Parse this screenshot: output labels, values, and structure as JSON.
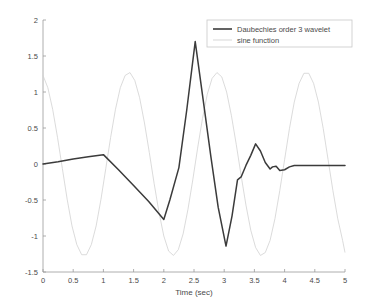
{
  "chart_data": {
    "type": "line",
    "title": "",
    "xlabel": "Time (sec)",
    "ylabel": "",
    "xlim": [
      0,
      5
    ],
    "ylim": [
      -1.5,
      2
    ],
    "grid": false,
    "legend_position": "upper right",
    "xticks": [
      "0",
      "0.5",
      "1",
      "1.5",
      "2",
      "2.5",
      "3",
      "3.5",
      "4",
      "4.5",
      "5"
    ],
    "xtick_values": [
      0,
      0.5,
      1,
      1.5,
      2,
      2.5,
      3,
      3.5,
      4,
      4.5,
      5
    ],
    "yticks": [
      "2",
      "1.5",
      "1",
      "0.5",
      "0",
      "-0.5",
      "-1",
      "-1.5"
    ],
    "ytick_values": [
      2,
      1.5,
      1,
      0.5,
      0,
      -0.5,
      -1,
      -1.5
    ],
    "colors": {
      "wavelet": "#3b3b3b",
      "sine": "#d2d2d2",
      "axis": "#9a9a9a",
      "text": "#4a4a4a",
      "background": "#ffffff"
    },
    "series": [
      {
        "name": "Daubechies order 3 wavelet",
        "color": "#3b3b3b",
        "x": [
          0.0,
          0.25,
          0.5,
          0.75,
          1.0,
          1.25,
          1.5,
          1.75,
          2.0,
          2.1,
          2.25,
          2.38,
          2.52,
          2.65,
          2.78,
          2.9,
          3.03,
          3.13,
          3.22,
          3.28,
          3.36,
          3.44,
          3.52,
          3.6,
          3.68,
          3.76,
          3.8,
          3.86,
          3.92,
          4.0,
          4.08,
          4.16,
          4.24,
          4.4,
          4.6,
          4.8,
          5.0
        ],
        "y": [
          0.0,
          0.03,
          0.07,
          0.1,
          0.13,
          -0.08,
          -0.3,
          -0.52,
          -0.77,
          -0.5,
          -0.05,
          0.75,
          1.7,
          0.9,
          0.1,
          -0.6,
          -1.14,
          -0.72,
          -0.22,
          -0.18,
          -0.02,
          0.12,
          0.28,
          0.18,
          0.02,
          -0.07,
          -0.04,
          -0.03,
          -0.09,
          -0.08,
          -0.04,
          -0.02,
          -0.02,
          -0.02,
          -0.02,
          -0.02,
          -0.02
        ]
      },
      {
        "name": "sine function",
        "color": "#d2d2d2",
        "amplitude": 1.27,
        "period": 1.6,
        "phase_note": "cosine-like, starts near +1.23 at t=0",
        "x": [
          0.0,
          0.08,
          0.16,
          0.24,
          0.32,
          0.4,
          0.48,
          0.56,
          0.64,
          0.72,
          0.8,
          0.88,
          0.96,
          1.04,
          1.12,
          1.2,
          1.28,
          1.36,
          1.44,
          1.52,
          1.6,
          1.68,
          1.76,
          1.84,
          1.92,
          2.0,
          2.08,
          2.16,
          2.24,
          2.32,
          2.4,
          2.48,
          2.56,
          2.64,
          2.72,
          2.8,
          2.88,
          2.96,
          3.04,
          3.12,
          3.2,
          3.28,
          3.36,
          3.44,
          3.52,
          3.6,
          3.68,
          3.76,
          3.84,
          3.92,
          4.0,
          4.08,
          4.16,
          4.24,
          4.32,
          4.4,
          4.48,
          4.56,
          4.64,
          4.72,
          4.8,
          4.88,
          4.96,
          5.0
        ],
        "y": [
          1.23,
          1.06,
          0.76,
          0.37,
          -0.06,
          -0.49,
          -0.86,
          -1.12,
          -1.26,
          -1.26,
          -1.12,
          -0.86,
          -0.49,
          -0.06,
          0.37,
          0.76,
          1.06,
          1.23,
          1.27,
          1.16,
          0.92,
          0.57,
          0.16,
          -0.27,
          -0.67,
          -1.0,
          -1.21,
          -1.27,
          -1.19,
          -0.97,
          -0.63,
          -0.22,
          0.22,
          0.63,
          0.97,
          1.19,
          1.27,
          1.21,
          1.0,
          0.67,
          0.27,
          -0.16,
          -0.57,
          -0.92,
          -1.16,
          -1.27,
          -1.23,
          -1.06,
          -0.76,
          -0.37,
          0.06,
          0.49,
          0.86,
          1.12,
          1.26,
          1.26,
          1.12,
          0.86,
          0.49,
          0.06,
          -0.37,
          -0.76,
          -1.06,
          -1.23
        ]
      }
    ]
  },
  "legend": {
    "entries": [
      {
        "label": "Daubechies order 3 wavelet"
      },
      {
        "label": "sine function"
      }
    ]
  }
}
